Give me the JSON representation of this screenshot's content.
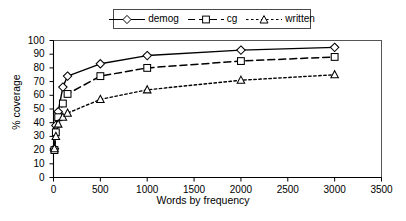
{
  "chart_data": {
    "type": "line",
    "title": "",
    "xlabel": "Words by frequency",
    "ylabel": "% coverage",
    "xlim": [
      0,
      3500
    ],
    "ylim": [
      0,
      100
    ],
    "xticks": [
      0,
      500,
      1000,
      1500,
      2000,
      2500,
      3000,
      3500
    ],
    "yticks": [
      0,
      10,
      20,
      30,
      40,
      50,
      60,
      70,
      80,
      90,
      100
    ],
    "grid": false,
    "legend_position": "top-center",
    "x": [
      10,
      25,
      50,
      100,
      150,
      500,
      1000,
      2000,
      3000
    ],
    "series": [
      {
        "name": "demog",
        "marker": "diamond",
        "linestyle": "solid",
        "color": "#000000",
        "values": [
          21,
          38,
          48,
          66,
          74,
          83,
          89,
          93,
          95
        ]
      },
      {
        "name": "cg",
        "marker": "square",
        "linestyle": "dashed",
        "color": "#000000",
        "values": [
          20,
          33,
          44,
          54,
          61,
          74,
          80,
          85,
          88
        ]
      },
      {
        "name": "written",
        "marker": "triangle",
        "linestyle": "dotted",
        "color": "#000000",
        "values": [
          21,
          30,
          39,
          44,
          47,
          57,
          64,
          71,
          75
        ]
      }
    ]
  },
  "legend": {
    "items": [
      {
        "label": "demog"
      },
      {
        "label": "cg"
      },
      {
        "label": "written"
      }
    ]
  },
  "axes": {
    "x_title": "Words by frequency",
    "y_title": "% coverage",
    "x_tick_labels": [
      "0",
      "500",
      "1000",
      "1500",
      "2000",
      "2500",
      "3000",
      "3500"
    ],
    "y_tick_labels": [
      "0",
      "10",
      "20",
      "30",
      "40",
      "50",
      "60",
      "70",
      "80",
      "90",
      "100"
    ]
  }
}
